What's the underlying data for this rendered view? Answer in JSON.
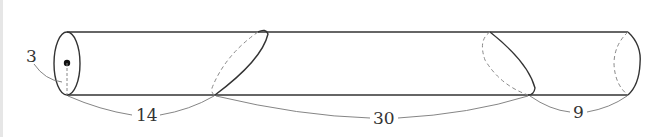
{
  "diagram": {
    "type": "cylinder-cut",
    "labels": {
      "radius": "3",
      "segment_left": "14",
      "segment_middle": "30",
      "segment_right": "9"
    },
    "colors": {
      "stroke": "#333333",
      "dashed": "#888888",
      "dimension": "#777777",
      "point": "#111111"
    }
  }
}
